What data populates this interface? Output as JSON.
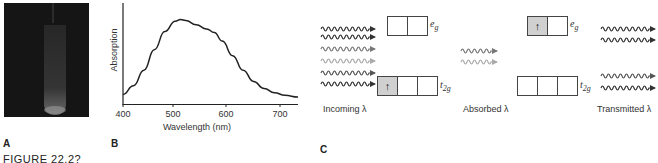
{
  "figure": {
    "caption_partial": "FIGURE 22.2?",
    "panels": {
      "a": {
        "label": "A",
        "description": "photograph of test tube with solution on dark background"
      },
      "b": {
        "label": "B"
      },
      "c": {
        "label": "C"
      }
    }
  },
  "chart_data": {
    "type": "line",
    "title": "",
    "xlabel": "Wavelength (nm)",
    "ylabel": "Absorption",
    "xlim": [
      400,
      735
    ],
    "x_ticks": [
      400,
      500,
      600,
      700
    ],
    "y_ticks": [],
    "grid": false,
    "legend": null,
    "series": [
      {
        "name": "absorption spectrum",
        "x": [
          400,
          420,
          440,
          460,
          480,
          500,
          510,
          520,
          540,
          560,
          575,
          590,
          610,
          630,
          650,
          670,
          690,
          710,
          735
        ],
        "y": [
          0.1,
          0.2,
          0.38,
          0.62,
          0.83,
          0.95,
          0.97,
          0.96,
          0.91,
          0.86,
          0.82,
          0.72,
          0.55,
          0.38,
          0.25,
          0.17,
          0.12,
          0.09,
          0.07
        ]
      }
    ],
    "annotations": "peak absorption near 510 nm with shoulder near 570 nm; y-axis unitless"
  },
  "diagram": {
    "incoming_label": "Incoming λ",
    "absorbed_label": "Absorbed λ",
    "transmitted_label": "Transmitted λ",
    "ground_state": {
      "eg": {
        "label_main": "e",
        "label_sub": "g",
        "cells": [
          "",
          ""
        ]
      },
      "t2g": {
        "label_main": "t",
        "label_sub": "2g",
        "cells": [
          "↑",
          "",
          ""
        ]
      }
    },
    "excited_state": {
      "eg": {
        "label_main": "e",
        "label_sub": "g",
        "cells": [
          "↑",
          ""
        ]
      },
      "t2g": {
        "label_main": "t",
        "label_sub": "2g",
        "cells": [
          "",
          "",
          ""
        ]
      }
    },
    "incoming_arrows": [
      "#333333",
      "#333333",
      "#777777",
      "#aaaaaa",
      "#555555",
      "#333333"
    ],
    "absorbed_arrows": [
      "#777777",
      "#aaaaaa"
    ],
    "transmitted_arrows": [
      "#333333",
      "#333333",
      "#555555",
      "#333333"
    ]
  }
}
